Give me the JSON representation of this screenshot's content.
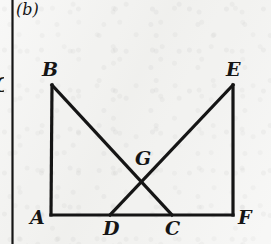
{
  "figure": {
    "caption": "(b)",
    "type": "geometry-diagram",
    "background_color": "#f2f2f0",
    "ink_color": "#151515",
    "cut_off_left_letter": "C",
    "gutter_rule": {
      "name": "column-divider",
      "x": 12.5,
      "thickness": 2.2
    },
    "points": [
      {
        "id": "A",
        "label": "A",
        "x": 51,
        "y": 215,
        "label_x": 30,
        "label_y": 208
      },
      {
        "id": "B",
        "label": "B",
        "x": 52,
        "y": 85,
        "label_x": 42,
        "label_y": 60
      },
      {
        "id": "C",
        "label": "C",
        "x": 172,
        "y": 215,
        "label_x": 165,
        "label_y": 219
      },
      {
        "id": "D",
        "label": "D",
        "x": 110,
        "y": 215,
        "label_x": 103,
        "label_y": 219
      },
      {
        "id": "E",
        "label": "E",
        "x": 233,
        "y": 85,
        "label_x": 226,
        "label_y": 60
      },
      {
        "id": "F",
        "label": "F",
        "x": 233,
        "y": 215,
        "label_x": 238,
        "label_y": 208
      },
      {
        "id": "G",
        "label": "G",
        "x": 143,
        "y": 181,
        "label_x": 135,
        "label_y": 149
      }
    ],
    "segments": [
      {
        "name": "segment-A-B",
        "from": "A",
        "to": "B",
        "width": 3.2
      },
      {
        "name": "segment-A-F",
        "from": "A",
        "to": "F",
        "width": 3.2
      },
      {
        "name": "segment-E-F",
        "from": "E",
        "to": "F",
        "width": 3.2
      },
      {
        "name": "segment-B-C",
        "from": "B",
        "to": "C",
        "width": 3.2
      },
      {
        "name": "segment-E-D",
        "from": "E",
        "to": "D",
        "width": 3.2
      }
    ],
    "intersection": {
      "name": "intersection-G",
      "of": [
        "segment-B-C",
        "segment-E-D"
      ],
      "label": "G"
    },
    "label_font_size": 19,
    "caption_font_size": 16,
    "caption_x": 16,
    "caption_y": 2
  }
}
